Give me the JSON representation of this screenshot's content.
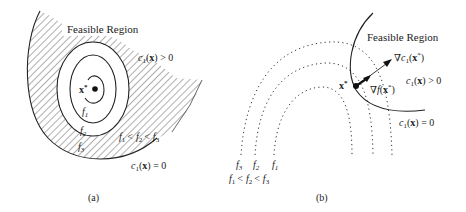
{
  "panel_a": {
    "caption": "(a)",
    "region_label": "Feasible Region",
    "constraint_positive": {
      "fn": "c",
      "sub": "1",
      "arg": "x",
      "rel": "> 0"
    },
    "constraint_zero": {
      "fn": "c",
      "sub": "1",
      "arg": "x",
      "rel": "= 0"
    },
    "optimum_label": "x",
    "optimum_sup": "*",
    "contours": [
      {
        "name": "f",
        "sub": "1"
      },
      {
        "name": "f",
        "sub": "2"
      },
      {
        "name": "f",
        "sub": "3"
      }
    ],
    "ordering": {
      "a": "f",
      "a_sub": "1",
      "op1": "<",
      "b": "f",
      "b_sub": "2",
      "op2": "<",
      "c": "f",
      "c_sub": "3"
    }
  },
  "panel_b": {
    "caption": "(b)",
    "region_label": "Feasible Region",
    "constraint_positive": {
      "fn": "c",
      "sub": "1",
      "arg": "x",
      "rel": "> 0"
    },
    "constraint_zero": {
      "fn": "c",
      "sub": "1",
      "arg": "x",
      "rel": "= 0"
    },
    "optimum_label": "x",
    "optimum_sup": "*",
    "grad_c": {
      "nabla": "∇",
      "fn": "c",
      "sub": "1",
      "arg": "x",
      "sup": "*"
    },
    "grad_f": {
      "nabla": "∇",
      "fn": "f",
      "arg": "x",
      "sup": "*"
    },
    "contours": [
      {
        "name": "f",
        "sub": "3"
      },
      {
        "name": "f",
        "sub": "2"
      },
      {
        "name": "f",
        "sub": "1"
      }
    ],
    "ordering": {
      "a": "f",
      "a_sub": "1",
      "op1": "<",
      "b": "f",
      "b_sub": "2",
      "op2": "<",
      "c": "f",
      "c_sub": "3"
    }
  }
}
